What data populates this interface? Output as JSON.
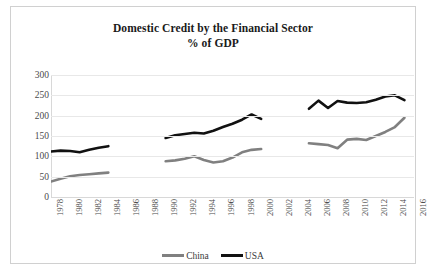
{
  "chart_data": {
    "type": "line",
    "title": "Domestic Credit by the Financial Sector",
    "subtitle": "% of GDP",
    "xlabel": "",
    "ylabel": "",
    "ylim": [
      0,
      300
    ],
    "ytick_step": 50,
    "ytick_labels": [
      "300",
      "250",
      "200",
      "150",
      "100",
      "50",
      "0"
    ],
    "xlim": [
      1978,
      2016
    ],
    "xtick_step": 2,
    "xtick_labels": [
      "1978",
      "1980",
      "1982",
      "1984",
      "1986",
      "1988",
      "1990",
      "1992",
      "1994",
      "1996",
      "1998",
      "2000",
      "2002",
      "2004",
      "2006",
      "2008",
      "2010",
      "2012",
      "2014",
      "2016"
    ],
    "grid": true,
    "legend_position": "bottom",
    "note": "Series are plotted in three disconnected segments; data missing for 1985-1989 and 2001-2004.",
    "series": [
      {
        "name": "China",
        "color": "#808080",
        "segments": [
          {
            "x": [
              1978,
              1979,
              1980,
              1981,
              1982,
              1983,
              1984
            ],
            "y": [
              38,
              45,
              51,
              54,
              56,
              58,
              60
            ]
          },
          {
            "x": [
              1990,
              1991,
              1992,
              1993,
              1994,
              1995,
              1996,
              1997,
              1998,
              1999,
              2000
            ],
            "y": [
              88,
              90,
              94,
              100,
              91,
              85,
              88,
              97,
              110,
              116,
              118
            ]
          },
          {
            "x": [
              2005,
              2006,
              2007,
              2008,
              2009,
              2010,
              2011,
              2012,
              2013,
              2014,
              2015
            ],
            "y": [
              132,
              130,
              128,
              120,
              141,
              143,
              140,
              150,
              160,
              172,
              195
            ]
          }
        ]
      },
      {
        "name": "USA",
        "color": "#111111",
        "segments": [
          {
            "x": [
              1978,
              1979,
              1980,
              1981,
              1982,
              1983,
              1984
            ],
            "y": [
              112,
              114,
              113,
              110,
              116,
              121,
              125
            ]
          },
          {
            "x": [
              1990,
              1991,
              1992,
              1993,
              1994,
              1995,
              1996,
              1997,
              1998,
              1999,
              2000
            ],
            "y": [
              145,
              152,
              155,
              158,
              156,
              163,
              172,
              180,
              190,
              203,
              192
            ]
          },
          {
            "x": [
              2005,
              2006,
              2007,
              2008,
              2009,
              2010,
              2011,
              2012,
              2013,
              2014,
              2015
            ],
            "y": [
              217,
              237,
              219,
              236,
              232,
              231,
              233,
              239,
              247,
              250,
              238
            ]
          }
        ]
      }
    ]
  },
  "legend": {
    "items": [
      {
        "label": "China",
        "color": "#808080"
      },
      {
        "label": "USA",
        "color": "#111111"
      }
    ]
  }
}
